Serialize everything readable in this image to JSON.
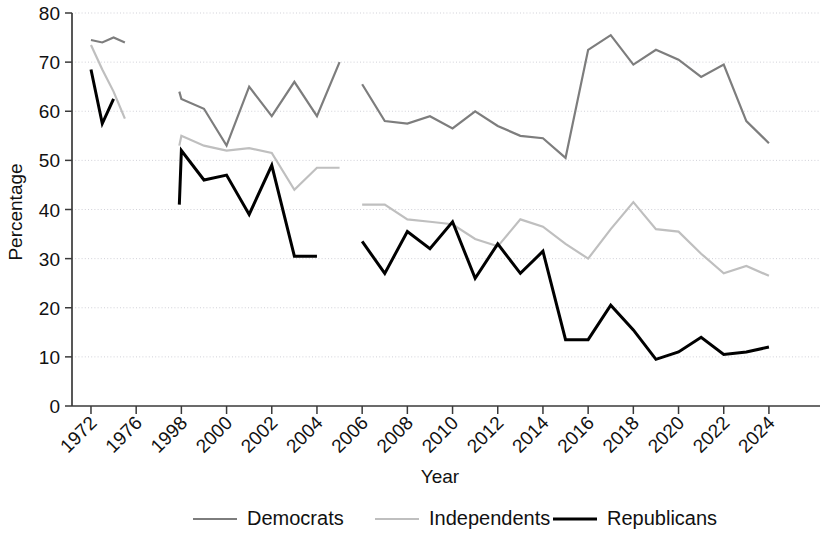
{
  "chart_data": {
    "type": "line",
    "title": "",
    "xlabel": "Year",
    "ylabel": "Percentage",
    "ylim": [
      0,
      80
    ],
    "ytick_step": 10,
    "yticks": [
      0,
      10,
      20,
      30,
      40,
      50,
      60,
      70,
      80
    ],
    "grid": true,
    "grid_axis": "y",
    "legend_position": "bottom",
    "xticks": [
      1972,
      1976,
      1998,
      2000,
      2002,
      2004,
      2006,
      2008,
      2010,
      2012,
      2014,
      2016,
      2018,
      2020,
      2022,
      2024
    ],
    "xlim": [
      1971,
      2025
    ],
    "x_all": [
      1972,
      1973,
      1974,
      1975,
      1997,
      1998,
      1999,
      2000,
      2001,
      2002,
      2003,
      2004,
      2006,
      2007,
      2008,
      2009,
      2010,
      2011,
      2012,
      2013,
      2014,
      2015,
      2016,
      2017,
      2018,
      2019,
      2020,
      2021,
      2022,
      2023,
      2024
    ],
    "series": [
      {
        "name": "Democrats",
        "color": "#7d7d7d",
        "width": 2.2,
        "segments": [
          {
            "x": [
              1972,
              1973,
              1974,
              1975
            ],
            "y": [
              74.5,
              74.0,
              75.0,
              74.0
            ]
          },
          {
            "x": [
              1997,
              1998,
              1999,
              2000,
              2001,
              2002,
              2003,
              2004,
              2005
            ],
            "y": [
              64.0,
              62.5,
              60.5,
              53.0,
              65.0,
              59.0,
              66.0,
              59.0,
              70.0
            ]
          },
          {
            "x": [
              2006,
              2007,
              2008,
              2009,
              2010,
              2011,
              2012,
              2013,
              2014,
              2015,
              2016,
              2017,
              2018,
              2019,
              2020,
              2021,
              2022,
              2023,
              2024
            ],
            "y": [
              65.5,
              58.0,
              57.5,
              59.0,
              56.5,
              60.0,
              57.0,
              55.0,
              54.5,
              50.5,
              72.5,
              75.5,
              69.5,
              72.5,
              70.5,
              67.0,
              69.5,
              58.0,
              53.5
            ]
          }
        ]
      },
      {
        "name": "Independents",
        "color": "#bfbfbf",
        "width": 2.2,
        "segments": [
          {
            "x": [
              1972,
              1973,
              1974,
              1975
            ],
            "y": [
              73.5,
              68.5,
              64.0,
              58.5
            ]
          },
          {
            "x": [
              1997,
              1998,
              1999,
              2000,
              2001,
              2002,
              2003,
              2004,
              2005
            ],
            "y": [
              53.0,
              55.0,
              53.0,
              52.0,
              52.5,
              51.5,
              44.0,
              48.5,
              48.5
            ]
          },
          {
            "x": [
              2006,
              2007,
              2008,
              2009,
              2010,
              2011,
              2012,
              2013,
              2014,
              2015,
              2016,
              2017,
              2018,
              2019,
              2020,
              2021,
              2022,
              2023,
              2024
            ],
            "y": [
              41.0,
              41.0,
              38.0,
              37.5,
              37.0,
              34.0,
              32.5,
              38.0,
              36.5,
              33.0,
              30.0,
              36.0,
              41.5,
              36.0,
              35.5,
              31.0,
              27.0,
              28.5,
              26.5
            ]
          }
        ]
      },
      {
        "name": "Republicans",
        "color": "#000000",
        "width": 3.0,
        "segments": [
          {
            "x": [
              1972,
              1973,
              1974
            ],
            "y": [
              68.5,
              57.5,
              62.5
            ]
          },
          {
            "x": [
              1997,
              1998,
              1999,
              2000,
              2001,
              2002,
              2003,
              2004
            ],
            "y": [
              41.0,
              52.0,
              46.0,
              47.0,
              39.0,
              49.0,
              30.5,
              30.5
            ]
          },
          {
            "x": [
              2006,
              2007,
              2008,
              2009,
              2010,
              2011,
              2012,
              2013,
              2014,
              2015,
              2016,
              2017,
              2018,
              2019,
              2020,
              2021,
              2022,
              2023,
              2024
            ],
            "y": [
              33.5,
              27.0,
              35.5,
              32.0,
              37.5,
              26.0,
              33.0,
              27.0,
              31.5,
              13.5,
              13.5,
              20.5,
              15.5,
              9.5,
              11.0,
              14.0,
              10.5,
              11.0,
              12.0
            ]
          }
        ]
      }
    ]
  },
  "legend": {
    "items": [
      {
        "label": "Democrats",
        "color": "#7d7d7d",
        "width": 2.2
      },
      {
        "label": "Independents",
        "color": "#bfbfbf",
        "width": 2.2
      },
      {
        "label": "Republicans",
        "color": "#000000",
        "width": 3.0
      }
    ]
  },
  "axes": {
    "x_title": "Year",
    "y_title": "Percentage"
  }
}
